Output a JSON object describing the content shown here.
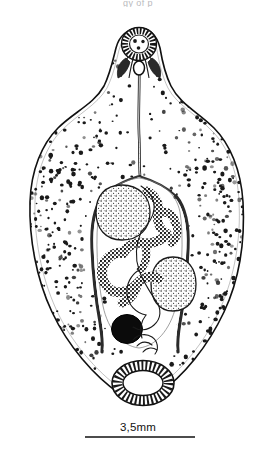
{
  "figure": {
    "kind": "scientific-line-drawing",
    "top_clipped_caption": "gy of p",
    "background_color": "#ffffff",
    "ink_color": "#111111"
  },
  "scale_bar": {
    "label": "3,5mm",
    "bar_x_start": 85,
    "bar_x_end": 195,
    "bar_y": 437,
    "bar_thickness": 1.6,
    "color": "#111111"
  },
  "body": {
    "outline_name": "body-outline",
    "head_tip_y": 28,
    "tail_tip_y": 403,
    "widest_left_x": 30,
    "widest_right_x": 243,
    "widest_y": 230,
    "stipple_color": "#1a1a1a",
    "stipple_count": 1500
  },
  "organs": [
    {
      "id": "oral-sucker",
      "label": "Oral sucker",
      "cx": 139,
      "cy": 44,
      "rx": 17,
      "ry": 16
    },
    {
      "id": "pharynx",
      "label": "Pharynx",
      "cx": 139,
      "cy": 68,
      "rx": 6,
      "ry": 7
    },
    {
      "id": "esophagus",
      "label": "Esophagus",
      "cx": 139,
      "cy": 110,
      "rx": 3,
      "ry": 40
    },
    {
      "id": "caecum-left",
      "label": "Left intestinal caecum",
      "cx": 99,
      "cy": 250,
      "rx": 8,
      "ry": 90
    },
    {
      "id": "caecum-right",
      "label": "Right intestinal caecum",
      "cx": 182,
      "cy": 250,
      "rx": 8,
      "ry": 90
    },
    {
      "id": "testis-anterior",
      "label": "Anterior testis",
      "cx": 122,
      "cy": 211,
      "rx": 25,
      "ry": 26
    },
    {
      "id": "testis-posterior",
      "label": "Posterior testis",
      "cx": 173,
      "cy": 283,
      "rx": 22,
      "ry": 27
    },
    {
      "id": "vitellaria",
      "label": "Vitellaria / ovary branches",
      "cx": 135,
      "cy": 245,
      "rx": 45,
      "ry": 55
    },
    {
      "id": "ovary",
      "label": "Ovary",
      "cx": 127,
      "cy": 329,
      "rx": 15,
      "ry": 14
    },
    {
      "id": "uterus",
      "label": "Uterus coil",
      "cx": 150,
      "cy": 330,
      "rx": 20,
      "ry": 45
    },
    {
      "id": "ventral-sucker",
      "label": "Ventral sucker (acetabulum)",
      "cx": 143,
      "cy": 383,
      "rx": 30,
      "ry": 22
    }
  ]
}
